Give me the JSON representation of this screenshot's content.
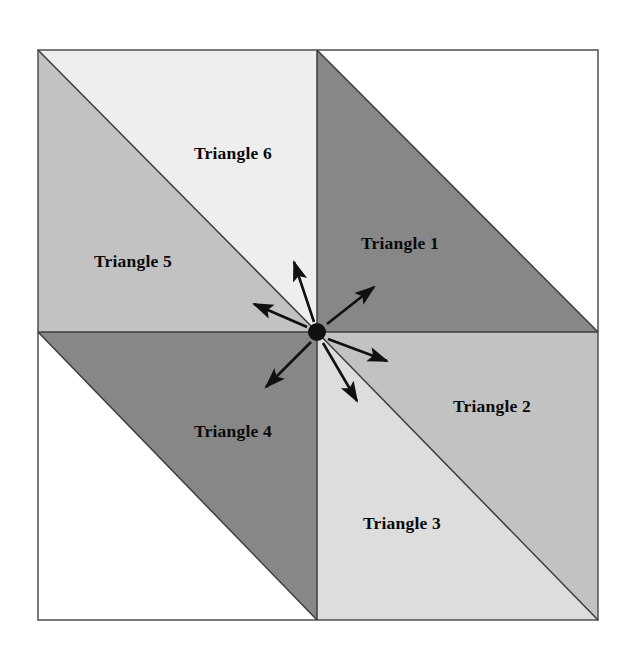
{
  "figure": {
    "background_color": "#ffffff",
    "border_color": "#5a5a5a",
    "outline_color": "#3c3c3c",
    "arrow_color": "#101010",
    "center_dot_color": "#111111",
    "square": {
      "left": 38,
      "top": 50,
      "right": 598,
      "bottom": 620
    },
    "center": {
      "x": 317,
      "y": 332
    },
    "center_dot_radius": 9
  },
  "regions": [
    {
      "id": "triangle-1",
      "label": "Triangle 1",
      "fill": "#878787",
      "shade": "dark-gray",
      "label_x": 400,
      "label_y": 245,
      "points": "317,50 598,332 317,332"
    },
    {
      "id": "triangle-2",
      "label": "Triangle 2",
      "fill": "#c2c2c2",
      "shade": "medium-light-gray",
      "label_x": 492,
      "label_y": 408,
      "points": "317,332 598,332 598,620"
    },
    {
      "id": "triangle-3",
      "label": "Triangle 3",
      "fill": "#dddddd",
      "shade": "light-gray",
      "label_x": 402,
      "label_y": 525,
      "points": "317,332 598,620 317,620"
    },
    {
      "id": "triangle-4",
      "label": "Triangle 4",
      "fill": "#878787",
      "shade": "dark-gray",
      "label_x": 233,
      "label_y": 433,
      "points": "317,332 317,620 38,332"
    },
    {
      "id": "triangle-5",
      "label": "Triangle 5",
      "fill": "#c2c2c2",
      "shade": "medium-light-gray",
      "label_x": 133,
      "label_y": 263,
      "points": "38,50 317,332 38,332"
    },
    {
      "id": "triangle-6",
      "label": "Triangle 6",
      "fill": "#eeeeee",
      "shade": "very-light-gray",
      "label_x": 233,
      "label_y": 155,
      "points": "38,50 317,50 317,332"
    },
    {
      "id": "blank-upper-right",
      "label": "",
      "fill": "#ffffff",
      "shade": "white",
      "label_x": 0,
      "label_y": 0,
      "points": "317,50 598,50 598,332"
    },
    {
      "id": "blank-lower-left",
      "label": "",
      "fill": "#ffffff",
      "shade": "white",
      "label_x": 0,
      "label_y": 0,
      "points": "38,332 317,620 38,620"
    }
  ],
  "arrows": [
    {
      "id": "arrow-to-triangle-1",
      "target_region": "Triangle 1",
      "tail_x": 327,
      "tail_y": 324,
      "tip_x": 374,
      "tip_y": 287,
      "direction": "up-right"
    },
    {
      "id": "arrow-to-triangle-2",
      "target_region": "Triangle 2",
      "tail_x": 328,
      "tail_y": 339,
      "tip_x": 387,
      "tip_y": 361,
      "direction": "right-down"
    },
    {
      "id": "arrow-to-triangle-3",
      "target_region": "Triangle 3",
      "tail_x": 323,
      "tail_y": 343,
      "tip_x": 357,
      "tip_y": 401,
      "direction": "down-right"
    },
    {
      "id": "arrow-to-triangle-4",
      "target_region": "Triangle 4",
      "tail_x": 311,
      "tail_y": 342,
      "tip_x": 266,
      "tip_y": 387,
      "direction": "down-left"
    },
    {
      "id": "arrow-to-triangle-5",
      "target_region": "Triangle 5",
      "tail_x": 307,
      "tail_y": 327,
      "tip_x": 254,
      "tip_y": 304,
      "direction": "left-up"
    },
    {
      "id": "arrow-to-triangle-6",
      "target_region": "Triangle 6",
      "tail_x": 314,
      "tail_y": 322,
      "tip_x": 294,
      "tip_y": 262,
      "direction": "up-left"
    }
  ]
}
